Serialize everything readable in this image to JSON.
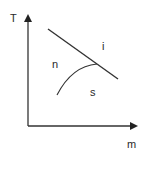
{
  "diagram": {
    "axes": {
      "y_label": "T",
      "x_label": "m"
    },
    "regions": {
      "upper": "i",
      "left": "n",
      "lower": "s"
    },
    "colors": {
      "line": "#333333",
      "text": "#2a2a2a",
      "background": "#ffffff"
    }
  }
}
